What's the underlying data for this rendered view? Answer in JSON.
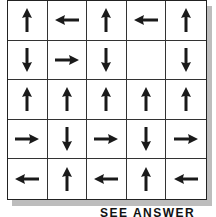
{
  "puzzle": {
    "rows": 5,
    "cols": 5,
    "cells": [
      [
        "up",
        "left",
        "up",
        "left",
        "up"
      ],
      [
        "down",
        "right",
        "down",
        "",
        "down"
      ],
      [
        "up",
        "up",
        "up",
        "up",
        "up"
      ],
      [
        "right",
        "down",
        "right",
        "down",
        "right"
      ],
      [
        "left",
        "up",
        "left",
        "up",
        "left"
      ]
    ]
  },
  "footer": {
    "text": "SEE ANSWER"
  }
}
